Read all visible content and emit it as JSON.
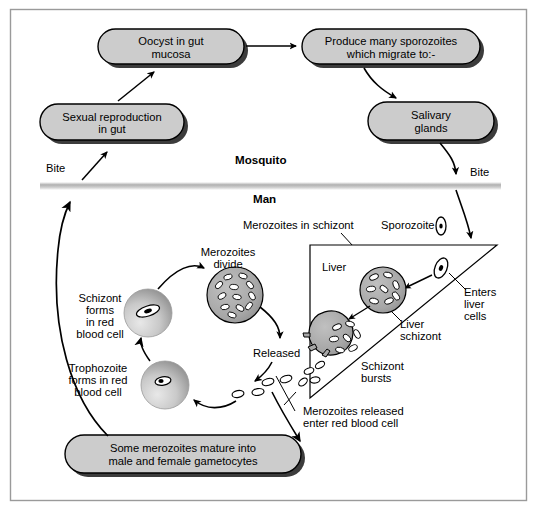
{
  "figure": {
    "border_color": "#9a9a9a",
    "box_fill": "#cccccc",
    "box_stroke": "#000000",
    "shadow_color": "#111111",
    "cell_fill": "#a8a8a8",
    "divider_color": "#b8b8b8"
  },
  "sections": {
    "mosquito_label": "Mosquito",
    "man_label": "Man"
  },
  "boxes": [
    {
      "id": "oocyst",
      "text_lines": [
        "Oocyst in gut",
        "mucosa"
      ]
    },
    {
      "id": "sporozoites",
      "text_lines": [
        "Produce many sporozoites",
        "which migrate to:-"
      ]
    },
    {
      "id": "sexual",
      "text_lines": [
        "Sexual reproduction",
        "in gut"
      ]
    },
    {
      "id": "salivary",
      "text_lines": [
        "Salivary",
        "glands"
      ]
    },
    {
      "id": "gametocytes",
      "text_lines": [
        "Some merozoites mature into",
        "male and female gametocytes"
      ]
    }
  ],
  "labels": {
    "bite_left": "Bite",
    "bite_right": "Bite",
    "sporozoite": "Sporozoite",
    "merozoites_in_schizont": "Merozoites in schizont",
    "liver": "Liver",
    "enters_liver_cells": [
      "Enters",
      "liver",
      "cells"
    ],
    "liver_schizont": [
      "Liver",
      "schizont"
    ],
    "schizont_bursts": [
      "Schizont",
      "bursts"
    ],
    "merozoites_divide": [
      "Merozoites",
      "divide"
    ],
    "released": "Released",
    "schizont_forms": [
      "Schizont",
      "forms",
      "in red",
      "blood cell"
    ],
    "trophozoite_forms": [
      "Trophozoite",
      "forms in red",
      "blood cell"
    ],
    "merozoites_released": [
      "Merozoites released",
      "enter red blood cell"
    ]
  }
}
